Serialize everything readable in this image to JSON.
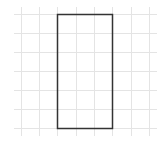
{
  "diagram": {
    "type": "grid-with-rectangle",
    "grid": {
      "columns_x": [
        21,
        39,
        57,
        76,
        94,
        112,
        131,
        149
      ],
      "rows_y": [
        14,
        33,
        52,
        71,
        90,
        109,
        128
      ],
      "extent": {
        "x1": 14,
        "x2": 157,
        "y1": 7,
        "y2": 136
      },
      "line_color": "#e4e4e4"
    },
    "rectangle": {
      "x": 57,
      "y": 14,
      "width": 55,
      "height": 114,
      "grid_units": {
        "width": 3,
        "height": 6
      },
      "stroke_color": "#333333",
      "stroke_width": 1.5
    }
  }
}
